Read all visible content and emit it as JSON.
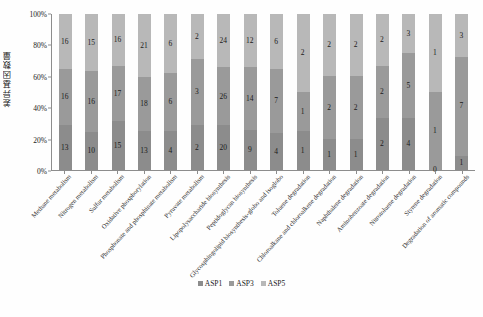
{
  "chart_data": {
    "type": "bar",
    "subtype": "stacked-100-percent",
    "title": "",
    "xlabel": "",
    "ylabel": "差异基因数量",
    "ylim": [
      0,
      100
    ],
    "ytick_labels": [
      "0%",
      "20%",
      "40%",
      "60%",
      "80%",
      "100%"
    ],
    "ytick_values": [
      0,
      20,
      40,
      60,
      80,
      100
    ],
    "grid": false,
    "legend_position": "bottom-center",
    "categories": [
      "Methane metabolism",
      "Nitrogen metabolism",
      "Sulfur metabolism",
      "Oxidative phosphorylation",
      "Phosphonate and phosphinate metabolism",
      "Pyruvate metabolism",
      "Lipopolysaccharide biosynthesis",
      "Peptidoglycan biosynthesis",
      "Glycosphingolipid biosynthesis-globo and isoglobo",
      "Toluene degradation",
      "Chloroalkane and chloroalkene degradation",
      "Naphthalene degradation",
      "Aminobenzoate degradation",
      "Nitrotoluene degradation",
      "Styrene degradation",
      "Degradation of aromatic compounds"
    ],
    "series": [
      {
        "name": "ASP1",
        "color": "#8c8c8c",
        "values": [
          13,
          10,
          15,
          13,
          4,
          2,
          20,
          9,
          4,
          1,
          1,
          1,
          2,
          4,
          0,
          1
        ]
      },
      {
        "name": "ASP3",
        "color": "#9a9a9a",
        "values": [
          16,
          16,
          17,
          18,
          6,
          3,
          26,
          14,
          7,
          1,
          2,
          2,
          2,
          5,
          1,
          7
        ]
      },
      {
        "name": "ASP5",
        "color": "#b8b8b8",
        "values": [
          16,
          15,
          16,
          21,
          6,
          2,
          24,
          12,
          6,
          2,
          2,
          2,
          2,
          3,
          1,
          3
        ]
      }
    ]
  },
  "legend": {
    "items": [
      {
        "label": "ASP1",
        "color": "#8c8c8c"
      },
      {
        "label": "ASP3",
        "color": "#9a9a9a"
      },
      {
        "label": "ASP5",
        "color": "#b8b8b8"
      }
    ]
  },
  "colors": {
    "axis": "#8d8d8d",
    "background": "#fefefe",
    "text": "#1b1b1b"
  }
}
